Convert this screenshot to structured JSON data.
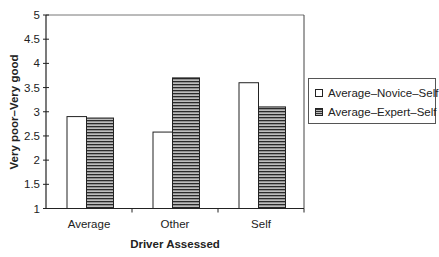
{
  "chart_data": {
    "type": "bar",
    "title": "",
    "xlabel": "Driver Assessed",
    "ylabel": "Very poor–Very good",
    "ylim": [
      1,
      5
    ],
    "yticks": [
      "1",
      "1.5",
      "2",
      "2.5",
      "3",
      "3.5",
      "4",
      "4.5",
      "5"
    ],
    "categories": [
      "Average",
      "Other",
      "Self"
    ],
    "series": [
      {
        "name": "Average–Novice–Self",
        "pattern": "white",
        "values": [
          2.9,
          2.58,
          3.6
        ]
      },
      {
        "name": "Average–Expert–Self",
        "pattern": "horizontal-hatch",
        "values": [
          2.87,
          3.7,
          3.1
        ]
      }
    ],
    "grid": false,
    "legend_position": "right"
  },
  "legend": {
    "items": [
      {
        "label": "Average–Novice–Self"
      },
      {
        "label": "Average–Expert–Self"
      }
    ]
  }
}
